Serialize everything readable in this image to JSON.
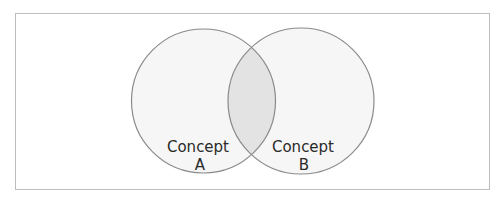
{
  "diagram": {
    "type": "venn",
    "sets": [
      {
        "id": "A",
        "line1": "Concept",
        "line2": "A",
        "cx": 203.5,
        "cy": 101,
        "r": 72
      },
      {
        "id": "B",
        "line1": "Concept",
        "line2": "B",
        "cx": 301,
        "cy": 101,
        "r": 73
      }
    ],
    "colors": {
      "stroke": "#8a8a8a",
      "fill": "#f6f6f6",
      "overlap": "#e3e3e3",
      "frame": "#bdbdbd",
      "text": "#2a2a2a"
    }
  }
}
